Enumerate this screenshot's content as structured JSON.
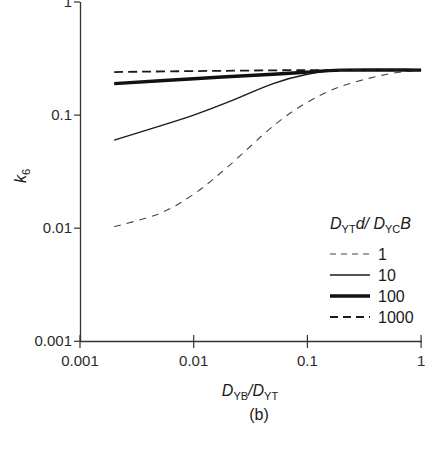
{
  "chart_data": {
    "type": "line",
    "title": "",
    "caption": "(b)",
    "xlabel": "D_YB/D_YT",
    "ylabel": "k_6",
    "xscale": "log",
    "yscale": "log",
    "xlim": [
      0.001,
      1
    ],
    "ylim": [
      0.001,
      1
    ],
    "grid": false,
    "x_ticks": [
      "0.001",
      "0.01",
      "0.1",
      "1"
    ],
    "y_ticks": [
      "0.001",
      "0.01",
      "0.1",
      "1"
    ],
    "legend": {
      "title": "D_YT d / D_YC B",
      "position": "lower right",
      "entries": [
        "1",
        "10",
        "100",
        "1000"
      ]
    },
    "series": [
      {
        "name": "1",
        "style": "short-dash thin",
        "x": [
          0.002,
          0.005,
          0.01,
          0.02,
          0.05,
          0.1,
          0.2,
          0.5,
          1
        ],
        "y": [
          0.0103,
          0.0135,
          0.02,
          0.035,
          0.08,
          0.13,
          0.18,
          0.23,
          0.25
        ]
      },
      {
        "name": "10",
        "style": "solid thin",
        "x": [
          0.002,
          0.005,
          0.01,
          0.02,
          0.05,
          0.1,
          0.2,
          0.5,
          1
        ],
        "y": [
          0.06,
          0.08,
          0.1,
          0.13,
          0.19,
          0.23,
          0.25,
          0.25,
          0.25
        ]
      },
      {
        "name": "100",
        "style": "solid thick",
        "x": [
          0.002,
          0.01,
          0.05,
          0.1,
          0.2,
          1
        ],
        "y": [
          0.19,
          0.21,
          0.23,
          0.24,
          0.25,
          0.25
        ]
      },
      {
        "name": "1000",
        "style": "long-dash medium",
        "x": [
          0.002,
          0.01,
          0.1,
          1
        ],
        "y": [
          0.24,
          0.245,
          0.25,
          0.25
        ]
      }
    ]
  },
  "labels": {
    "x_main": "D",
    "x_sub1": "YB",
    "x_slash": "/D",
    "x_sub2": "YT",
    "y_main": "k",
    "y_sub": "6",
    "legend_d1": "D",
    "legend_sub1": "YT",
    "legend_mid": "d/ D",
    "legend_sub2": "YC",
    "legend_end": "B",
    "caption": "(b)"
  },
  "colors": {
    "axis": "#333333",
    "line": "#1a1a1a",
    "dash_light": "#444444"
  }
}
